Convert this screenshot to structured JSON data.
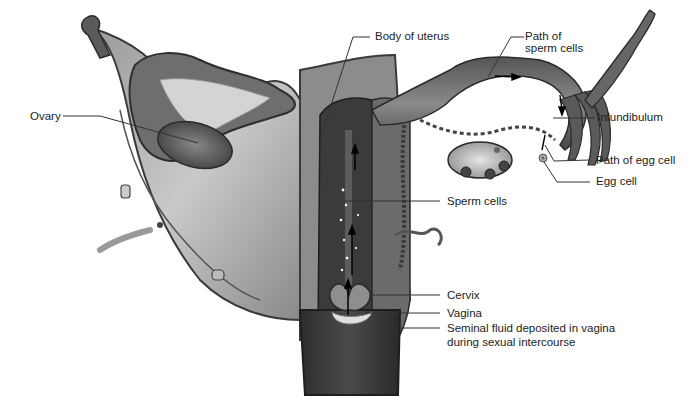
{
  "figure": {
    "style": "grayscale anatomical illustration"
  },
  "labels": {
    "ovary": "Ovary",
    "body_of_uterus": "Body of uterus",
    "path_of_sperm_line1": "Path of",
    "path_of_sperm_line2": "sperm cells",
    "infundibulum": "Infundibulum",
    "path_of_egg": "Path of egg cell",
    "egg_cell": "Egg cell",
    "sperm_cells": "Sperm cells",
    "cervix": "Cervix",
    "vagina": "Vagina",
    "seminal_line1": "Seminal fluid deposited in vagina",
    "seminal_line2": "during sexual intercourse"
  },
  "colors": {
    "background": "#ffffff",
    "leader_line": "#333333",
    "tissue_dark": "#3a3a3a",
    "tissue_mid": "#7a7a7a",
    "tissue_light": "#c8c8c8"
  }
}
